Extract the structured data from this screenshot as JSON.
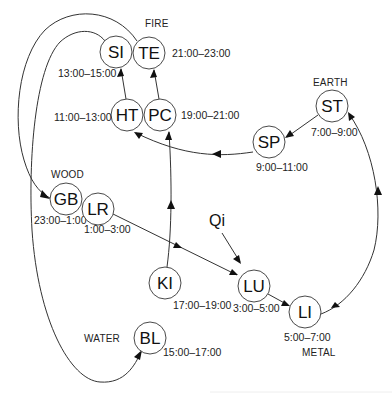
{
  "diagram": {
    "elements": [
      {
        "id": "fire",
        "label": "FIRE",
        "x": 145,
        "y": 27
      },
      {
        "id": "earth",
        "label": "EARTH",
        "x": 313,
        "y": 86
      },
      {
        "id": "wood",
        "label": "WOOD",
        "x": 51,
        "y": 178
      },
      {
        "id": "water",
        "label": "WATER",
        "x": 84,
        "y": 342
      },
      {
        "id": "metal",
        "label": "METAL",
        "x": 302,
        "y": 356
      }
    ],
    "nodes": [
      {
        "id": "SI",
        "label": "SI",
        "cx": 116,
        "cy": 52,
        "r": 16,
        "time": "13:00–15:00",
        "tx": 58,
        "ty": 77
      },
      {
        "id": "TE",
        "label": "TE",
        "cx": 149,
        "cy": 53,
        "r": 16,
        "time": "21:00–23:00",
        "tx": 172,
        "ty": 57
      },
      {
        "id": "HT",
        "label": "HT",
        "cx": 127,
        "cy": 115,
        "r": 16,
        "time": "11:00–13:00",
        "tx": 54,
        "ty": 121
      },
      {
        "id": "PC",
        "label": "PC",
        "cx": 160,
        "cy": 115,
        "r": 16,
        "time": "19:00–21:00",
        "tx": 181,
        "ty": 119
      },
      {
        "id": "ST",
        "label": "ST",
        "cx": 332,
        "cy": 106,
        "r": 16,
        "time": "7:00–9:00",
        "tx": 311,
        "ty": 136
      },
      {
        "id": "SP",
        "label": "SP",
        "cx": 269,
        "cy": 142,
        "r": 16,
        "time": "9:00–11:00",
        "tx": 256,
        "ty": 171
      },
      {
        "id": "GB",
        "label": "GB",
        "cx": 66,
        "cy": 199,
        "r": 16,
        "time": "23:00–1:00",
        "tx": 34,
        "ty": 224
      },
      {
        "id": "LR",
        "label": "LR",
        "cx": 98,
        "cy": 209,
        "r": 16,
        "time": "1:00–3:00",
        "tx": 84,
        "ty": 233
      },
      {
        "id": "KI",
        "label": "KI",
        "cx": 165,
        "cy": 283,
        "r": 16,
        "time": "17:00–19:00",
        "tx": 173,
        "ty": 309
      },
      {
        "id": "LU",
        "label": "LU",
        "cx": 254,
        "cy": 286,
        "r": 16,
        "time": "3:00–5:00",
        "tx": 233,
        "ty": 312
      },
      {
        "id": "LI",
        "label": "LI",
        "cx": 305,
        "cy": 312,
        "r": 16,
        "time": "5:00–7:00",
        "tx": 284,
        "ty": 341
      },
      {
        "id": "BL",
        "label": "BL",
        "cx": 150,
        "cy": 338,
        "r": 16,
        "time": "15:00–17:00",
        "tx": 163,
        "ty": 356
      }
    ],
    "qi": {
      "label": "Qi",
      "x": 209,
      "y": 226
    },
    "edges": [
      {
        "from": "TE",
        "to": "GB"
      },
      {
        "from": "SI",
        "to": "BL"
      },
      {
        "from": "HT",
        "to": "SI"
      },
      {
        "from": "PC",
        "to": "TE"
      },
      {
        "from": "ST",
        "to": "SP"
      },
      {
        "from": "SP",
        "to": "HT"
      },
      {
        "from": "KI",
        "to": "PC"
      },
      {
        "from": "LR",
        "to": "LU"
      },
      {
        "from": "Qi",
        "to": "LU"
      },
      {
        "from": "LU",
        "to": "LI"
      },
      {
        "from": "LI",
        "to": "ST"
      },
      {
        "from": "BL",
        "to": "KI"
      }
    ],
    "colors": {
      "stroke": "#333333",
      "background": "#ffffff",
      "text": "#111111"
    }
  }
}
